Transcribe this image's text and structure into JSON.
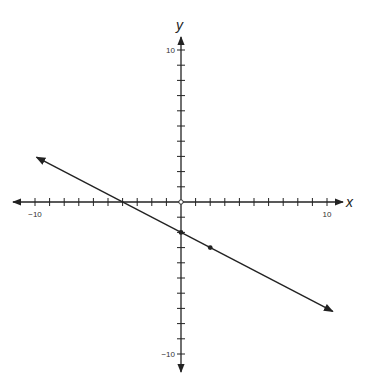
{
  "chart_data": {
    "type": "line",
    "title": "",
    "xlabel": "x",
    "ylabel": "y",
    "xlim": [
      -10,
      10
    ],
    "ylim": [
      -10,
      10
    ],
    "tick_step": 1,
    "tick_labels": {
      "x": [
        {
          "value": -10,
          "label": "−10"
        },
        {
          "value": 10,
          "label": "10"
        }
      ],
      "y": [
        {
          "value": 10,
          "label": "10"
        },
        {
          "value": -10,
          "label": "−10"
        }
      ]
    },
    "grid": false,
    "series": [
      {
        "name": "line",
        "equation": "y = -1/2 x - 2",
        "slope": -0.5,
        "intercept": -2,
        "x_range": [
          -9.9,
          10.4
        ],
        "arrows": "both",
        "points": [
          {
            "x": 0,
            "y": -2
          },
          {
            "x": 2,
            "y": -3
          }
        ]
      }
    ],
    "origin_marker": "open-circle",
    "color": "#222222"
  }
}
